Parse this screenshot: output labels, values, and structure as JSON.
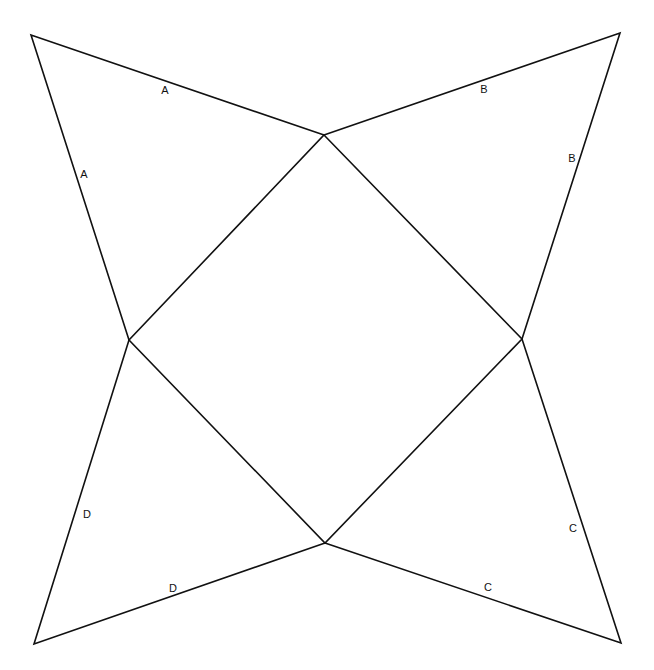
{
  "diagram": {
    "type": "pyramid-net",
    "vertices": {
      "top_left": [
        31,
        35
      ],
      "top": [
        324,
        135
      ],
      "top_right": [
        620,
        33
      ],
      "left": [
        129,
        340
      ],
      "right": [
        522,
        339
      ],
      "bottom_left": [
        34,
        644
      ],
      "bottom": [
        325,
        543
      ],
      "bottom_right": [
        621,
        643
      ]
    },
    "square_base": [
      "top",
      "right",
      "bottom",
      "left"
    ],
    "flaps": [
      {
        "name": "A",
        "points": [
          "left",
          "top_left",
          "top"
        ]
      },
      {
        "name": "B",
        "points": [
          "top",
          "top_right",
          "right"
        ]
      },
      {
        "name": "C",
        "points": [
          "right",
          "bottom_right",
          "bottom"
        ]
      },
      {
        "name": "D",
        "points": [
          "bottom",
          "bottom_left",
          "left"
        ]
      }
    ],
    "labels": [
      {
        "text": "A",
        "x": 165,
        "y": 90
      },
      {
        "text": "A",
        "x": 84,
        "y": 174
      },
      {
        "text": "B",
        "x": 484,
        "y": 89
      },
      {
        "text": "B",
        "x": 572,
        "y": 158
      },
      {
        "text": "C",
        "x": 573,
        "y": 528
      },
      {
        "text": "C",
        "x": 488,
        "y": 587
      },
      {
        "text": "D",
        "x": 87,
        "y": 514
      },
      {
        "text": "D",
        "x": 173,
        "y": 588
      }
    ],
    "line_color": "#111111",
    "background": "#ffffff"
  }
}
